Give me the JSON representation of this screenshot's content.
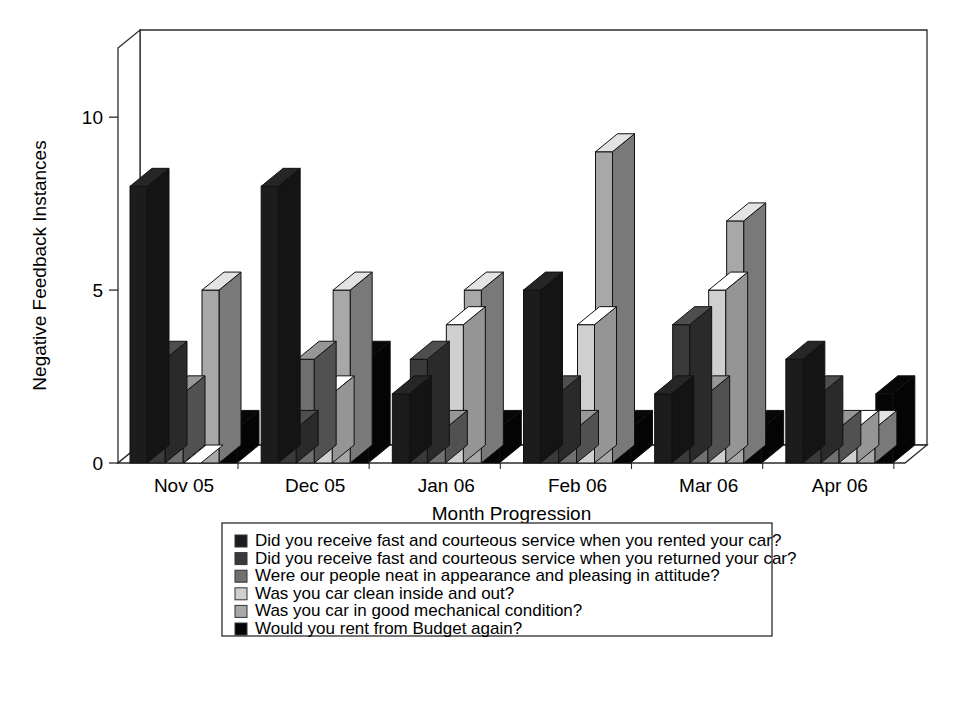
{
  "chart_data": {
    "type": "bar",
    "title": "",
    "xlabel": "Month Progression",
    "ylabel": "Negative Feedback Instances",
    "categories": [
      "Nov 05",
      "Dec 05",
      "Jan 06",
      "Feb 06",
      "Mar 06",
      "Apr 06"
    ],
    "ylim": [
      0,
      12
    ],
    "yticks": [
      0,
      5,
      10
    ],
    "ytick_labels": [
      "0",
      "5",
      "10"
    ],
    "grid": false,
    "legend_position": "bottom",
    "three_d": true,
    "series": [
      {
        "name": "Did you receive fast and courteous service when you rented your car?",
        "color": "#1c1c1c",
        "values": [
          8,
          8,
          2,
          5,
          2,
          3
        ]
      },
      {
        "name": "Did you receive fast and courteous service when you returned your car?",
        "color": "#3a3a3a",
        "values": [
          3,
          1,
          3,
          2,
          4,
          2
        ]
      },
      {
        "name": "Were our people neat in appearance and pleasing in attitude?",
        "color": "#707070",
        "values": [
          2,
          3,
          1,
          1,
          2,
          1
        ]
      },
      {
        "name": "Was you car clean inside and out?",
        "color": "#cfcfcf",
        "values": [
          0,
          2,
          4,
          4,
          5,
          1
        ]
      },
      {
        "name": "Was you car in good mechanical condition?",
        "color": "#a8a8a8",
        "values": [
          5,
          5,
          5,
          9,
          7,
          1
        ]
      },
      {
        "name": "Would you rent from Budget again?",
        "color": "#050505",
        "values": [
          1,
          3,
          1,
          1,
          1,
          2
        ]
      }
    ]
  }
}
